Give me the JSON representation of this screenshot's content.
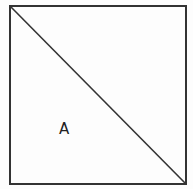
{
  "diagram": {
    "shape": "square",
    "square": {
      "x": 10,
      "y": 6,
      "width": 176,
      "height": 178
    },
    "diagonal": {
      "from": "top-left",
      "to": "bottom-right",
      "x1": 10,
      "y1": 6,
      "x2": 186,
      "y2": 184
    },
    "stroke_color": "#333333",
    "stroke_width": 2,
    "regions": [
      {
        "label": "A",
        "position": "lower-left triangle",
        "x": 59,
        "y": 122
      }
    ]
  }
}
